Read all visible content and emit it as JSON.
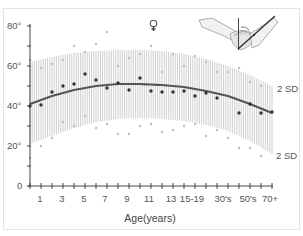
{
  "chart_data": {
    "type": "scatter",
    "title": "",
    "xlabel": "Age(years)",
    "ylabel": "",
    "ylim": [
      0,
      80
    ],
    "y_ticks": [
      "0",
      "20°",
      "40°",
      "60°",
      "80°"
    ],
    "x_tick_labels": [
      "1",
      "3",
      "5",
      "7",
      "9",
      "11",
      "13",
      "15-19",
      "30's",
      "50's",
      "70+"
    ],
    "legend": [],
    "annotations": {
      "sex_symbol": "♀",
      "upper_band_label": "2 SD",
      "lower_band_label": "2 SD",
      "illustration": "shoulder abduction/flexion range-of-motion figure"
    },
    "grid": false,
    "series": [
      {
        "name": "mean curve",
        "type": "line",
        "x": [
          0,
          2,
          4,
          6,
          8,
          10,
          12,
          14,
          16,
          18,
          20,
          22
        ],
        "values": [
          41,
          45,
          48,
          50,
          51,
          51,
          50.5,
          49.5,
          47.5,
          45,
          41,
          36.5
        ]
      },
      {
        "name": "+2 SD",
        "type": "band-upper",
        "x": [
          0,
          2,
          4,
          6,
          8,
          10,
          12,
          14,
          16,
          18,
          20,
          22
        ],
        "values": [
          62,
          64.5,
          66.5,
          67.5,
          68,
          68,
          67.5,
          66,
          63.5,
          60,
          55.5,
          50
        ]
      },
      {
        "name": "-2 SD",
        "type": "band-lower",
        "x": [
          0,
          2,
          4,
          6,
          8,
          10,
          12,
          14,
          16,
          18,
          20,
          22
        ],
        "values": [
          21,
          25,
          29,
          32,
          33.5,
          34,
          33.5,
          32.5,
          30.5,
          27.5,
          22.5,
          16
        ]
      },
      {
        "name": "mean values",
        "type": "scatter",
        "x": [
          0,
          1,
          2,
          3,
          4,
          5,
          6,
          7,
          8,
          9,
          10,
          11,
          12,
          13,
          14,
          15,
          16,
          17,
          19,
          20,
          21,
          22
        ],
        "values": [
          40,
          40.5,
          47,
          50,
          51,
          56,
          53,
          49,
          51.5,
          48,
          54,
          47.5,
          47,
          47,
          47.5,
          45,
          46.5,
          44,
          36.5,
          41,
          36.5,
          37
        ]
      },
      {
        "name": "individual extremes (upper)",
        "type": "scatter",
        "x": [
          0,
          1,
          2,
          3,
          4,
          5,
          6,
          7,
          8,
          9,
          10,
          11,
          12,
          13,
          14,
          15,
          16,
          17,
          18,
          19,
          20,
          21
        ],
        "values": [
          63,
          59,
          61,
          63,
          70,
          67,
          71,
          77,
          60,
          64,
          66,
          70,
          57,
          66,
          60,
          65,
          62,
          57,
          57,
          59,
          52,
          50
        ]
      },
      {
        "name": "individual extremes (lower)",
        "type": "scatter",
        "x": [
          0,
          1,
          2,
          3,
          4,
          5,
          6,
          7,
          8,
          9,
          10,
          11,
          12,
          13,
          14,
          15,
          16,
          17,
          18,
          19,
          20,
          21
        ],
        "values": [
          14,
          20,
          24,
          32,
          30,
          35,
          29,
          31,
          26,
          26,
          30,
          31,
          27,
          28,
          30,
          31,
          25,
          28,
          24,
          19,
          19,
          15
        ]
      }
    ]
  }
}
